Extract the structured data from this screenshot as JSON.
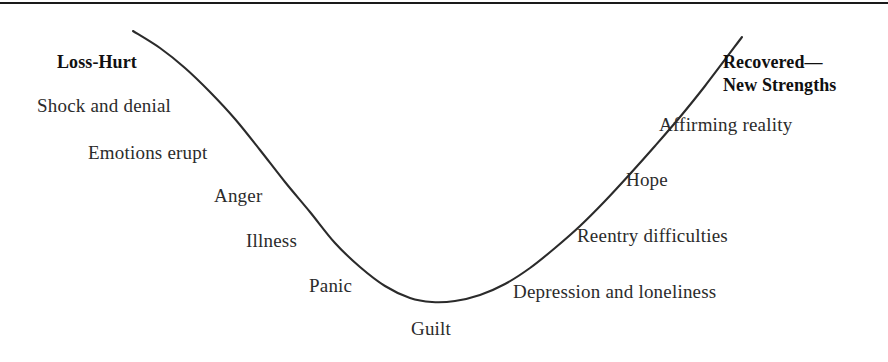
{
  "figure": {
    "background_color": "#ffffff",
    "rule_color": "#1a1a1a",
    "curve_color": "#2b2b2b",
    "text_color": "#2b2b2b"
  },
  "labels": {
    "start_stage": "Loss-Hurt",
    "end_stage_line1": "Recovered—",
    "end_stage_line2": "New Strengths",
    "descending": [
      "Shock and denial",
      "Emotions erupt",
      "Anger",
      "Illness",
      "Panic"
    ],
    "bottom": "Guilt",
    "ascending": [
      "Depression and loneliness",
      "Reentry difficulties",
      "Hope",
      "Affirming reality"
    ]
  },
  "chart_data": {
    "type": "line",
    "xlabel": "",
    "ylabel": "",
    "grid": false,
    "legend": "none",
    "xlim": [
      0,
      888
    ],
    "ylim": [
      362,
      0
    ],
    "annotations": [
      {
        "text": "Loss-Hurt",
        "x": 57,
        "y": 68,
        "bold": true
      },
      {
        "text": "Shock and denial",
        "x": 37,
        "y": 113,
        "bold": false
      },
      {
        "text": "Emotions erupt",
        "x": 88,
        "y": 160,
        "bold": false
      },
      {
        "text": "Anger",
        "x": 214,
        "y": 203,
        "bold": false
      },
      {
        "text": "Illness",
        "x": 246,
        "y": 248,
        "bold": false
      },
      {
        "text": "Panic",
        "x": 309,
        "y": 293,
        "bold": false
      },
      {
        "text": "Guilt",
        "x": 411,
        "y": 336,
        "bold": false
      },
      {
        "text": "Depression and loneliness",
        "x": 513,
        "y": 299,
        "bold": false
      },
      {
        "text": "Reentry difficulties",
        "x": 577,
        "y": 243,
        "bold": false
      },
      {
        "text": "Hope",
        "x": 626,
        "y": 187,
        "bold": false
      },
      {
        "text": "Affirming reality",
        "x": 659,
        "y": 132,
        "bold": false
      },
      {
        "text": "Recovered— New Strengths",
        "x": 723,
        "y": 69,
        "bold": true
      }
    ],
    "series": [
      {
        "name": "grief-curve",
        "x": [
          133,
          160,
          185,
          210,
          235,
          260,
          285,
          310,
          335,
          360,
          385,
          410,
          432,
          455,
          480,
          505,
          530,
          555,
          580,
          605,
          630,
          655,
          680,
          705,
          742
        ],
        "y": [
          31,
          48,
          68,
          92,
          119,
          150,
          182,
          212,
          243,
          267,
          286,
          298,
          302,
          301,
          295,
          284,
          268,
          248,
          226,
          201,
          174,
          146,
          117,
          86,
          37
        ]
      }
    ]
  }
}
